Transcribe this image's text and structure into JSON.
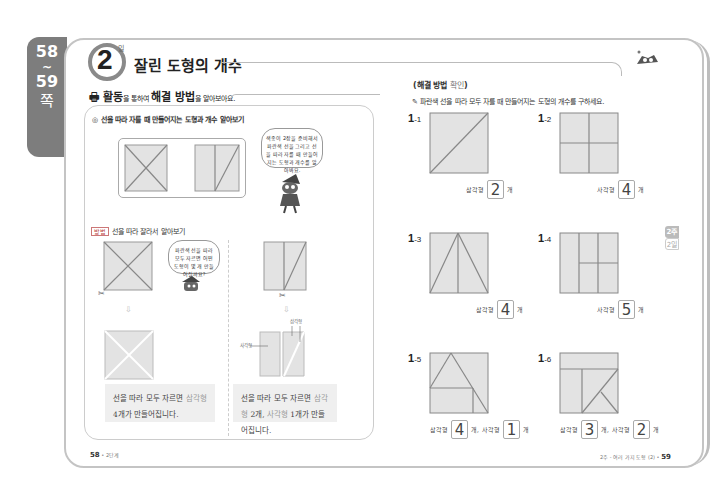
{
  "page_tab": {
    "from": "58",
    "tilde": "~",
    "to": "59",
    "unit": "쪽"
  },
  "lesson": {
    "number": "2",
    "suffix": "일",
    "title": "잘린 도형의 개수"
  },
  "activity": {
    "head_bold1": "활동",
    "head_small1": "을 통하여 ",
    "head_bold2": "해결 방법",
    "head_small2": "을 알아보아요.",
    "bullet": "◎ 선을 따라 자를 때 만들어지는 도형과 개수 알아보기",
    "speech1": "색종이 2장을 준비해서 파란색 선을 그리고 선을 따라 자를 때 만들어지는 도형과 개수를 알아봐요.",
    "method_tag": "방법",
    "method_text": "선을 따라 잘라서 알아보기",
    "speech2": "파란색 선을 따라 모두 자르면 어떤 도형이 몇 개 만들어질까요?",
    "label_square": "사각형",
    "label_triangle": "삼각형",
    "result_left_1": "선을 따라 모두 자르면 ",
    "result_left_hl": "삼각형",
    "result_left_2": " 4개가 만들어집니다.",
    "result_right_1": "선을 따라 모두 자르면 ",
    "result_right_hl1": "삼각형",
    "result_right_2": " 2개,",
    "result_right_hl2": "사각형",
    "result_right_3": " 1개가 만들어집니다."
  },
  "practice": {
    "section_bold": "해결 방법",
    "section_light": " 확인",
    "instruction": "파란색 선을 따라 모두 자를 때 만들어지는 도형의 개수를 구하세요.",
    "problems": [
      {
        "main": "1",
        "sub": "-1",
        "answers": [
          {
            "label": "삼각형",
            "value": "2",
            "unit": "개"
          }
        ]
      },
      {
        "main": "1",
        "sub": "-2",
        "answers": [
          {
            "label": "사각형",
            "value": "4",
            "unit": "개"
          }
        ]
      },
      {
        "main": "1",
        "sub": "-3",
        "answers": [
          {
            "label": "삼각형",
            "value": "4",
            "unit": "개"
          }
        ]
      },
      {
        "main": "1",
        "sub": "-4",
        "answers": [
          {
            "label": "사각형",
            "value": "5",
            "unit": "개"
          }
        ]
      },
      {
        "main": "1",
        "sub": "-5",
        "answers": [
          {
            "label": "삼각형",
            "value": "4",
            "unit": "개,"
          },
          {
            "label": "사각형",
            "value": "1",
            "unit": "개"
          }
        ]
      },
      {
        "main": "1",
        "sub": "-6",
        "answers": [
          {
            "label": "삼각형",
            "value": "3",
            "unit": "개,"
          },
          {
            "label": "사각형",
            "value": "2",
            "unit": "개"
          }
        ]
      }
    ]
  },
  "side_tab": {
    "week": "2주",
    "day": "2일"
  },
  "footer": {
    "left_page": "58",
    "left_text": " • 2단계",
    "right_text": "2주 - 여러 가지 도형 (2) • ",
    "right_page": "59"
  },
  "colors": {
    "tab_gray": "#7d7d7d",
    "shape_fill": "#e3e3e3",
    "line": "#888888"
  }
}
